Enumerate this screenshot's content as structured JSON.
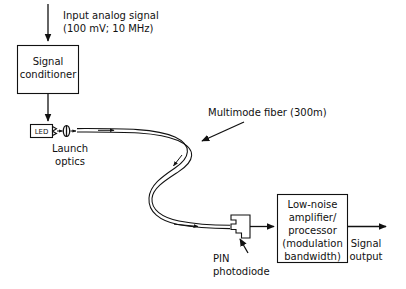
{
  "diagram": {
    "colors": {
      "stroke": "#111111",
      "background": "#ffffff",
      "text": "#111111"
    },
    "input_label": {
      "line1": "Input analog signal",
      "line2": "(100 mV; 10 MHz)"
    },
    "signal_conditioner": {
      "line1": "Signal",
      "line2": "conditioner"
    },
    "led": {
      "label": "LED"
    },
    "launch_optics": {
      "line1": "Launch",
      "line2": "optics"
    },
    "fiber": {
      "label": "Multimode fiber (300m)"
    },
    "photodiode": {
      "line1": "PIN",
      "line2": "photodiode"
    },
    "amplifier": {
      "line1": "Low-noise",
      "line2": "amplifier/",
      "line3": "processor",
      "line4": "(modulation",
      "line5": "bandwidth)"
    },
    "output_label": {
      "line1": "Signal",
      "line2": "output"
    },
    "icons": {
      "input_arrow": "arrow-down-icon",
      "conditioner_to_led_arrow": "arrow-down-icon",
      "fiber_flow_arrow": "arrow-right-icon",
      "fiber_pointer_arrow": "arrow-down-left-icon",
      "photodiode_pointer_arrow": "arrow-up-icon",
      "output_arrow": "arrow-right-icon",
      "lens": "lens-ellipse-icon"
    }
  }
}
